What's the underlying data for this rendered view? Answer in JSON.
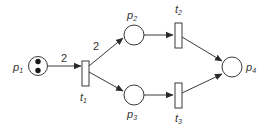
{
  "diagram": {
    "type": "petri-net",
    "colors": {
      "stroke": "#3a3a3a",
      "text": "#333333",
      "background": "#ffffff",
      "token": "#1a1a1a"
    },
    "places": [
      {
        "id": "p1",
        "base": "p",
        "sub": "1",
        "tokens": 2
      },
      {
        "id": "p2",
        "base": "p",
        "sub": "2",
        "tokens": 0
      },
      {
        "id": "p3",
        "base": "p",
        "sub": "3",
        "tokens": 0
      },
      {
        "id": "p4",
        "base": "p",
        "sub": "4",
        "tokens": 0
      }
    ],
    "transitions": [
      {
        "id": "t1",
        "base": "t",
        "sub": "1"
      },
      {
        "id": "t2",
        "base": "t",
        "sub": "2"
      },
      {
        "id": "t3",
        "base": "t",
        "sub": "3"
      }
    ],
    "arcs": [
      {
        "from": "p1",
        "to": "t1",
        "weight": "2"
      },
      {
        "from": "t1",
        "to": "p2",
        "weight": "2"
      },
      {
        "from": "t1",
        "to": "p3",
        "weight": ""
      },
      {
        "from": "p2",
        "to": "t2",
        "weight": ""
      },
      {
        "from": "p3",
        "to": "t3",
        "weight": ""
      },
      {
        "from": "t2",
        "to": "p4",
        "weight": ""
      },
      {
        "from": "t3",
        "to": "p4",
        "weight": ""
      }
    ],
    "labels": {
      "p1": {
        "base": "p",
        "sub": "1"
      },
      "p2": {
        "base": "p",
        "sub": "2"
      },
      "p3": {
        "base": "p",
        "sub": "3"
      },
      "p4": {
        "base": "p",
        "sub": "4"
      },
      "t1": {
        "base": "t",
        "sub": "1"
      },
      "t2": {
        "base": "t",
        "sub": "2"
      },
      "t3": {
        "base": "t",
        "sub": "3"
      },
      "w_p1_t1": "2",
      "w_t1_p2": "2"
    }
  }
}
